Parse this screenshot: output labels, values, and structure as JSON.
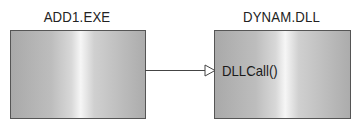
{
  "diagram": {
    "left_module": {
      "label": "ADD1.EXE"
    },
    "right_module": {
      "label": "DYNAM.DLL",
      "function": "DLLCall()"
    },
    "connection": {
      "from": "ADD1.EXE",
      "to": "DLLCall()",
      "arrowhead": "open-triangle"
    }
  }
}
